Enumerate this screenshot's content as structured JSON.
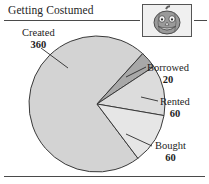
{
  "header": {
    "title": "Getting Costumed",
    "icon": "jack-o-lantern-icon"
  },
  "chart_data": {
    "type": "pie",
    "title": "Getting Costumed",
    "xlabel": "",
    "ylabel": "",
    "total": 500,
    "categories": [
      "Created",
      "Borrowed",
      "Rented",
      "Bought"
    ],
    "values": [
      360,
      20,
      60,
      60
    ],
    "slices": [
      {
        "label": "Created",
        "value": 360,
        "color": "#d3d3d3",
        "start_deg": 47,
        "sweep_deg": 259
      },
      {
        "label": "Borrowed",
        "value": 20,
        "color": "#a8a8a8",
        "start_deg": 33,
        "sweep_deg": 14
      },
      {
        "label": "Rented",
        "value": 60,
        "color": "#dcdcdc",
        "start_deg": -10,
        "sweep_deg": 43
      },
      {
        "label": "Bought",
        "value": 60,
        "color": "#e6e6e6",
        "start_deg": -53,
        "sweep_deg": 43
      }
    ],
    "legend": "callout-labels",
    "grid": false
  },
  "labels": {
    "created": {
      "name": "Created",
      "value": "360"
    },
    "borrowed": {
      "name": "Borrowed",
      "value": "20"
    },
    "rented": {
      "name": "Rented",
      "value": "60"
    },
    "bought": {
      "name": "Bought",
      "value": "60"
    }
  },
  "colors": {
    "created": "#d3d3d3",
    "borrowed": "#a8a8a8",
    "rented": "#dcdcdc",
    "bought": "#e6e6e6",
    "outline": "#3a3a3a",
    "rule": "#4a4a4a",
    "pumpkin_body": "#8c8c8c",
    "pumpkin_stem": "#6e6e6e"
  }
}
